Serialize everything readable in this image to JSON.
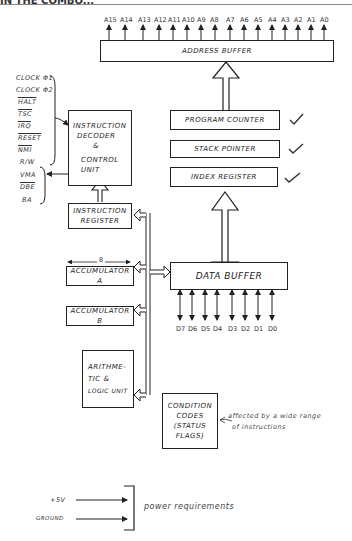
{
  "header": {
    "text": "IN THE COMBO..."
  },
  "address_lines": [
    "A15",
    "A14",
    "A13",
    "A12",
    "A11",
    "A10",
    "A9",
    "A8",
    "A7",
    "A6",
    "A5",
    "A4",
    "A3",
    "A2",
    "A1",
    "A0"
  ],
  "data_lines": [
    "D7",
    "D6",
    "D5",
    "D4",
    "D3",
    "D2",
    "D1",
    "D0"
  ],
  "blocks": {
    "address_buffer": "ADDRESS BUFFER",
    "instruction_decoder_1": "INSTRUCTION",
    "instruction_decoder_2": "DECODER",
    "instruction_decoder_3": "&",
    "instruction_decoder_4": "CONTROL",
    "instruction_decoder_5": "UNIT",
    "program_counter": "PROGRAM COUNTER",
    "stack_pointer": "STACK POINTER",
    "index_register": "INDEX REGISTER",
    "instruction_register_1": "INSTRUCTION",
    "instruction_register_2": "REGISTER",
    "accumulator_a": "ACCUMULATOR A",
    "accumulator_b": "ACCUMULATOR B",
    "data_buffer": "DATA BUFFER",
    "alu_1": "ARITHME-",
    "alu_2": "TIC &",
    "alu_3": "LOGIC UNIT",
    "cc_1": "CONDITION",
    "cc_2": "CODES",
    "cc_3": "(STATUS",
    "cc_4": "FLAGS)"
  },
  "bit_width_label": "8",
  "control_inputs": [
    "CLOCK Φ1",
    "CLOCK Φ2",
    "HALT",
    "TSC",
    "IRQ",
    "RESET",
    "NMI"
  ],
  "control_outputs": [
    "R/W",
    "VMA",
    "DBE",
    "BA"
  ],
  "annotations": {
    "condition_codes_note_1": "affected by a wide range",
    "condition_codes_note_2": "of instructions",
    "power_plus": "+5V",
    "power_ground": "GROUND",
    "power_note": "power requirements"
  },
  "colors": {
    "ink": "#222222",
    "paper": "#ffffff"
  }
}
